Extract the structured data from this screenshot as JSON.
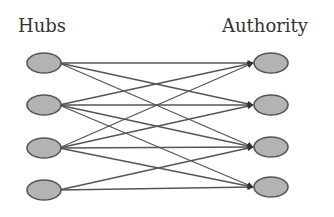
{
  "diagram": {
    "type": "bipartite-graph",
    "left_group_label": "Hubs",
    "right_group_label": "Authority",
    "colors": {
      "node_fill": "#b3b3b3",
      "node_stroke": "#555555",
      "edge": "#555555",
      "text": "#333333",
      "background": "#ffffff"
    },
    "hubs": [
      {
        "id": "H1",
        "cx": 44,
        "cy": 63
      },
      {
        "id": "H2",
        "cx": 44,
        "cy": 105
      },
      {
        "id": "H3",
        "cx": 44,
        "cy": 148
      },
      {
        "id": "H4",
        "cx": 44,
        "cy": 190
      }
    ],
    "authorities": [
      {
        "id": "A1",
        "cx": 271,
        "cy": 63
      },
      {
        "id": "A2",
        "cx": 271,
        "cy": 105
      },
      {
        "id": "A3",
        "cx": 271,
        "cy": 147
      },
      {
        "id": "A4",
        "cx": 271,
        "cy": 187
      }
    ],
    "edges": [
      [
        "H1",
        "A1"
      ],
      [
        "H1",
        "A2"
      ],
      [
        "H1",
        "A3"
      ],
      [
        "H2",
        "A1"
      ],
      [
        "H2",
        "A2"
      ],
      [
        "H2",
        "A3"
      ],
      [
        "H2",
        "A4"
      ],
      [
        "H3",
        "A1"
      ],
      [
        "H3",
        "A2"
      ],
      [
        "H3",
        "A3"
      ],
      [
        "H3",
        "A4"
      ],
      [
        "H4",
        "A3"
      ],
      [
        "H4",
        "A4"
      ]
    ]
  }
}
